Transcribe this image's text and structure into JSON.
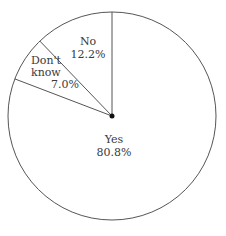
{
  "chart_data": {
    "type": "pie",
    "title": "",
    "start_angle_deg": 0,
    "direction": "counterclockwise",
    "categories": [
      "No",
      "Don't know",
      "Yes"
    ],
    "values": [
      12.2,
      7.0,
      80.8
    ],
    "value_labels": [
      "12.2%",
      "7.0%",
      "80.8%"
    ],
    "colors": [
      "#ffffff",
      "#ffffff",
      "#ffffff"
    ],
    "legend": "none"
  },
  "labels": {
    "no": {
      "name": "No",
      "pct": "12.2%"
    },
    "dontknow": {
      "name1": "Don't",
      "name2": "know",
      "pct": "7.0%"
    },
    "yes": {
      "name": "Yes",
      "pct": "80.8%"
    }
  },
  "style": {
    "stroke": "#555555",
    "background": "#ffffff"
  }
}
